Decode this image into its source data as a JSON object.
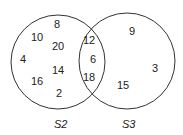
{
  "diagram": {
    "type": "venn",
    "sets": [
      {
        "label": "S2",
        "only": [
          "8",
          "10",
          "20",
          "4",
          "14",
          "16",
          "2"
        ]
      },
      {
        "label": "S3",
        "only": [
          "9",
          "3",
          "15"
        ]
      }
    ],
    "intersection": [
      "12",
      "6",
      "18"
    ],
    "labels": {
      "s2": "S2",
      "s3": "S3"
    },
    "values": {
      "s2_a": "8",
      "s2_b": "10",
      "s2_c": "20",
      "s2_d": "4",
      "s2_e": "14",
      "s2_f": "16",
      "s2_g": "2",
      "both_a": "12",
      "both_b": "6",
      "both_c": "18",
      "s3_a": "9",
      "s3_b": "3",
      "s3_c": "15"
    }
  }
}
